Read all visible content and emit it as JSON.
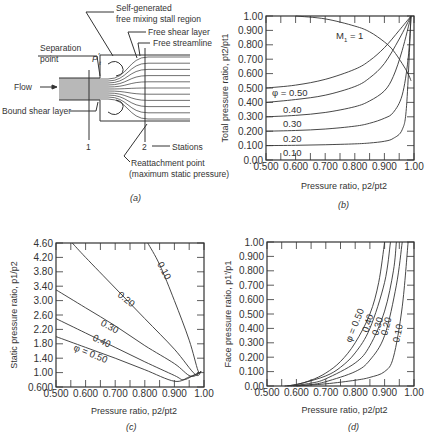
{
  "figure": {
    "panels": [
      {
        "id": "a",
        "caption": "(a)"
      },
      {
        "id": "b",
        "caption": "(b)"
      },
      {
        "id": "c",
        "caption": "(c)"
      },
      {
        "id": "d",
        "caption": "(d)"
      }
    ]
  },
  "diagram_a": {
    "labels": {
      "self_generated_1": "Self-generated",
      "self_generated_2": "free mixing stall region",
      "free_shear_layer": "Free shear layer",
      "free_streamline": "Free streamline",
      "separation_1": "Separation",
      "separation_2": "point",
      "pt_symbol": "P",
      "pt_sub": "t",
      "pt_prime": "'",
      "flow": "Flow",
      "bound_shear_layer": "Bound shear layer",
      "station_1": "1",
      "station_2": "2",
      "stations": "Stations",
      "reattachment_1": "Reattachment point",
      "reattachment_2": "(maximum static pressure)"
    },
    "caption": "(a)"
  },
  "chart_data": [
    {
      "panel": "b",
      "type": "line",
      "title": "",
      "xlabel": "Pressure ratio, p2/pt2",
      "ylabel": "Total pressure ratio, pt2/pt1",
      "xlim": [
        0.5,
        1.0
      ],
      "ylim": [
        0.0,
        1.0
      ],
      "xticks": [
        "0.500",
        "0.600",
        "0.700",
        "0.800",
        "0.900",
        "1.00"
      ],
      "yticks": [
        "0.00",
        "0.100",
        "0.200",
        "0.300",
        "0.400",
        "0.500",
        "0.600",
        "0.700",
        "0.800",
        "0.900",
        "1.00"
      ],
      "legend_position": "inline labels",
      "series": [
        {
          "name": "φ = 0.50",
          "label": "φ = 0.50",
          "x": [
            0.5,
            0.6,
            0.7,
            0.8,
            0.85,
            0.9,
            0.95,
            0.99
          ],
          "y": [
            0.5,
            0.52,
            0.56,
            0.63,
            0.69,
            0.78,
            0.9,
            1.0
          ]
        },
        {
          "name": "0.40",
          "label": "0.40",
          "x": [
            0.5,
            0.6,
            0.7,
            0.8,
            0.85,
            0.9,
            0.95,
            0.99
          ],
          "y": [
            0.4,
            0.42,
            0.45,
            0.51,
            0.57,
            0.67,
            0.84,
            1.0
          ]
        },
        {
          "name": "0.30",
          "label": "0.30",
          "x": [
            0.5,
            0.6,
            0.7,
            0.8,
            0.85,
            0.9,
            0.93,
            0.96,
            0.99
          ],
          "y": [
            0.3,
            0.31,
            0.33,
            0.37,
            0.41,
            0.48,
            0.58,
            0.76,
            1.0
          ]
        },
        {
          "name": "0.20",
          "label": "0.20",
          "x": [
            0.5,
            0.6,
            0.7,
            0.8,
            0.85,
            0.9,
            0.93,
            0.96,
            0.98,
            0.99
          ],
          "y": [
            0.2,
            0.205,
            0.215,
            0.235,
            0.255,
            0.29,
            0.33,
            0.45,
            0.7,
            1.0
          ]
        },
        {
          "name": "0.10",
          "label": "0.10",
          "x": [
            0.5,
            0.6,
            0.7,
            0.8,
            0.85,
            0.9,
            0.93,
            0.96,
            0.975,
            0.99
          ],
          "y": [
            0.1,
            0.102,
            0.106,
            0.112,
            0.118,
            0.13,
            0.15,
            0.21,
            0.38,
            1.0
          ]
        },
        {
          "name": "M1 = 1",
          "label": "M",
          "label_sub": "1",
          "label_suffix": " = 1",
          "x": [
            0.6,
            0.7,
            0.8,
            0.85,
            0.9,
            0.93,
            0.96,
            0.98,
            0.99
          ],
          "y": [
            1.0,
            0.98,
            0.93,
            0.89,
            0.82,
            0.76,
            0.67,
            0.6,
            0.55
          ]
        }
      ]
    },
    {
      "panel": "c",
      "type": "line",
      "title": "",
      "xlabel": "Pressure ratio, p2/pt2",
      "ylabel": "Static pressure ratio, p1/p2",
      "xlim": [
        0.5,
        1.0
      ],
      "ylim": [
        0.6,
        4.6
      ],
      "xticks": [
        "0.500",
        "0.600",
        "0.700",
        "0.800",
        "0.900",
        "1.00"
      ],
      "yticks": [
        "0.600",
        "1.00",
        "1.40",
        "1.80",
        "2.20",
        "2.60",
        "3.00",
        "3.40",
        "3.80",
        "4.20",
        "4.60"
      ],
      "legend_position": "inline labels",
      "series": [
        {
          "name": "φ = 0.50",
          "label": "φ = 0.50",
          "x": [
            0.5,
            0.6,
            0.7,
            0.8,
            0.9,
            0.95,
            0.99
          ],
          "y": [
            2.0,
            1.7,
            1.4,
            1.08,
            0.76,
            0.88,
            1.02
          ]
        },
        {
          "name": "0.40",
          "label": "0.40",
          "x": [
            0.5,
            0.6,
            0.7,
            0.8,
            0.9,
            0.93,
            0.96,
            0.99
          ],
          "y": [
            2.5,
            2.1,
            1.7,
            1.3,
            0.92,
            0.8,
            0.9,
            1.02
          ]
        },
        {
          "name": "0.30",
          "label": "0.30",
          "x": [
            0.5,
            0.6,
            0.7,
            0.8,
            0.9,
            0.955,
            0.99
          ],
          "y": [
            3.3,
            2.8,
            2.3,
            1.75,
            1.25,
            0.9,
            1.02
          ]
        },
        {
          "name": "0.20",
          "label": "0.20",
          "x": [
            0.555,
            0.6,
            0.7,
            0.8,
            0.9,
            0.97,
            0.99
          ],
          "y": [
            4.6,
            4.2,
            3.35,
            2.5,
            1.65,
            0.95,
            1.03
          ]
        },
        {
          "name": "0.10",
          "label": "0.10",
          "x": [
            0.81,
            0.85,
            0.9,
            0.95,
            0.98,
            0.99
          ],
          "y": [
            4.6,
            4.0,
            3.0,
            1.9,
            1.05,
            1.04
          ]
        }
      ]
    },
    {
      "panel": "d",
      "type": "line",
      "title": "",
      "xlabel": "Pressure ratio, p2/pt2",
      "ylabel": "Face pressure ratio, p1'/p1",
      "xlim": [
        0.5,
        1.0
      ],
      "ylim": [
        0.0,
        1.0
      ],
      "xticks": [
        "0.500",
        "0.600",
        "0.700",
        "0.800",
        "0.900",
        "1.00"
      ],
      "yticks": [
        "0.00",
        "0.100",
        "0.200",
        "0.300",
        "0.400",
        "0.500",
        "0.600",
        "0.700",
        "0.800",
        "0.900",
        "1.00"
      ],
      "legend_position": "inline labels",
      "series": [
        {
          "name": "φ = 0.50",
          "label": "φ = 0.50",
          "x": [
            0.56,
            0.6,
            0.65,
            0.7,
            0.75,
            0.8,
            0.85,
            0.88,
            0.9
          ],
          "y": [
            0.0,
            0.01,
            0.04,
            0.09,
            0.17,
            0.3,
            0.5,
            0.72,
            1.0
          ]
        },
        {
          "name": "0.40",
          "label": "0.40",
          "x": [
            0.57,
            0.62,
            0.7,
            0.75,
            0.8,
            0.85,
            0.9,
            0.92
          ],
          "y": [
            0.0,
            0.02,
            0.07,
            0.13,
            0.23,
            0.4,
            0.72,
            1.0
          ]
        },
        {
          "name": "0.30",
          "label": "0.30",
          "x": [
            0.58,
            0.65,
            0.7,
            0.8,
            0.85,
            0.9,
            0.93,
            0.94
          ],
          "y": [
            0.0,
            0.02,
            0.05,
            0.16,
            0.28,
            0.52,
            0.8,
            1.0
          ]
        },
        {
          "name": "0.20",
          "label": "0.20",
          "x": [
            0.59,
            0.65,
            0.7,
            0.8,
            0.85,
            0.9,
            0.94,
            0.96
          ],
          "y": [
            0.0,
            0.01,
            0.03,
            0.1,
            0.18,
            0.35,
            0.7,
            1.0
          ]
        },
        {
          "name": "0.10",
          "label": "0.10",
          "x": [
            0.6,
            0.7,
            0.8,
            0.85,
            0.9,
            0.93,
            0.96,
            0.98
          ],
          "y": [
            0.0,
            0.015,
            0.04,
            0.06,
            0.1,
            0.2,
            0.55,
            1.0
          ]
        }
      ]
    }
  ]
}
